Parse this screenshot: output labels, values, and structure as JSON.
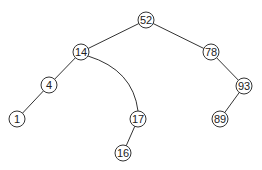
{
  "diagram": {
    "type": "binary-search-tree",
    "nodes": [
      {
        "id": "n52",
        "label": "52",
        "x": 146,
        "y": 20
      },
      {
        "id": "n14",
        "label": "14",
        "x": 81,
        "y": 52
      },
      {
        "id": "n78",
        "label": "78",
        "x": 211,
        "y": 52
      },
      {
        "id": "n4",
        "label": "4",
        "x": 49,
        "y": 85
      },
      {
        "id": "n93",
        "label": "93",
        "x": 244,
        "y": 86
      },
      {
        "id": "n1",
        "label": "1",
        "x": 17,
        "y": 119
      },
      {
        "id": "n17",
        "label": "17",
        "x": 138,
        "y": 119
      },
      {
        "id": "n89",
        "label": "89",
        "x": 220,
        "y": 119
      },
      {
        "id": "n16",
        "label": "16",
        "x": 123,
        "y": 153
      }
    ],
    "edges": [
      {
        "from": "52",
        "to": "14",
        "style": "straight"
      },
      {
        "from": "52",
        "to": "78",
        "style": "straight"
      },
      {
        "from": "14",
        "to": "4",
        "style": "straight"
      },
      {
        "from": "14",
        "to": "17",
        "style": "curved"
      },
      {
        "from": "4",
        "to": "1",
        "style": "straight"
      },
      {
        "from": "78",
        "to": "93",
        "style": "straight"
      },
      {
        "from": "93",
        "to": "89",
        "style": "straight"
      },
      {
        "from": "17",
        "to": "16",
        "style": "straight"
      }
    ]
  }
}
